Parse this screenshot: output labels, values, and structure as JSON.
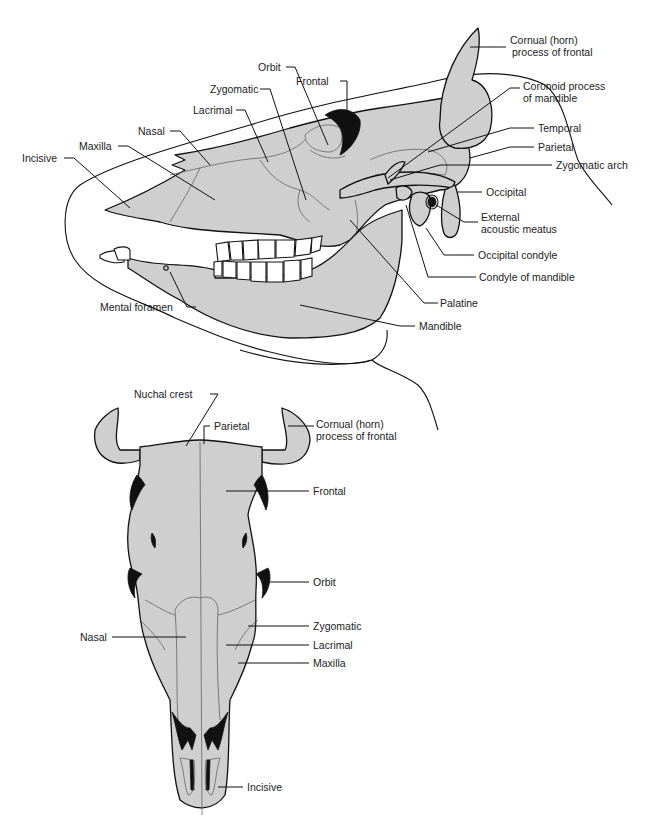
{
  "figure": {
    "views": [
      {
        "id": "lateral",
        "name": "Lateral view of bovine skull",
        "labels": {
          "orbit": "Orbit",
          "frontal": "Frontal",
          "zygomatic": "Zygomatic",
          "lacrimal": "Lacrimal",
          "nasal": "Nasal",
          "maxilla": "Maxilla",
          "incisive": "Incisive",
          "cornual_line1": "Cornual (horn)",
          "cornual_line2": "process of frontal",
          "coronoid_line1": "Coronoid process",
          "coronoid_line2": "of mandible",
          "temporal": "Temporal",
          "parietal": "Parietal",
          "zygomatic_arch": "Zygomatic arch",
          "occipital": "Occipital",
          "ext_acoustic_line1": "External",
          "ext_acoustic_line2": "acoustic meatus",
          "occipital_condyle": "Occipital condyle",
          "condyle_mandible": "Condyle of mandible",
          "palatine": "Palatine",
          "mandible": "Mandible",
          "mental_foramen": "Mental foramen"
        }
      },
      {
        "id": "dorsal",
        "name": "Dorsal view of bovine skull",
        "labels": {
          "nuchal_crest": "Nuchal crest",
          "parietal": "Parietal",
          "cornual_line1": "Cornual (horn)",
          "cornual_line2": "process of frontal",
          "frontal": "Frontal",
          "orbit": "Orbit",
          "zygomatic": "Zygomatic",
          "lacrimal": "Lacrimal",
          "maxilla": "Maxilla",
          "nasal": "Nasal",
          "incisive": "Incisive"
        }
      }
    ],
    "colors": {
      "bone_fill": "#cfcfcf",
      "line": "#111111",
      "background": "#ffffff"
    }
  }
}
